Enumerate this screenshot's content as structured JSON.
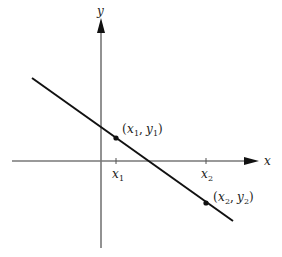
{
  "diagram": {
    "type": "coordinate-plane-line",
    "axes": {
      "x_label": "x",
      "y_label": "y",
      "axis_color": "#777777"
    },
    "line": {
      "color": "#111111",
      "slope": "negative"
    },
    "points": [
      {
        "name": "P1",
        "label_open": "(",
        "x_var": "x",
        "x_sub": "1",
        "sep": ", ",
        "y_var": "y",
        "y_sub": "1",
        "label_close": ")"
      },
      {
        "name": "P2",
        "label_open": "(",
        "x_var": "x",
        "x_sub": "2",
        "sep": ", ",
        "y_var": "y",
        "y_sub": "2",
        "label_close": ")"
      }
    ],
    "ticks": [
      {
        "var": "x",
        "sub": "1"
      },
      {
        "var": "x",
        "sub": "2"
      }
    ]
  }
}
